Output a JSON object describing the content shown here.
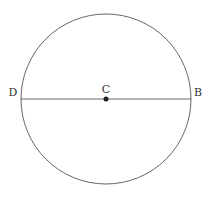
{
  "diagram": {
    "type": "geometry-circle-diameter",
    "circle": {
      "cx": 106,
      "cy": 99,
      "r": 85,
      "stroke": "#666666"
    },
    "diameter": {
      "from": "D",
      "to": "B",
      "stroke": "#666666"
    },
    "points": [
      {
        "label": "D",
        "x": 21,
        "y": 99,
        "label_x": 13,
        "label_y": 96
      },
      {
        "label": "C",
        "x": 106,
        "y": 99,
        "label_x": 106,
        "label_y": 93,
        "marker": "dot"
      },
      {
        "label": "B",
        "x": 191,
        "y": 99,
        "label_x": 198,
        "label_y": 96
      }
    ],
    "dot_color": "#222222"
  }
}
